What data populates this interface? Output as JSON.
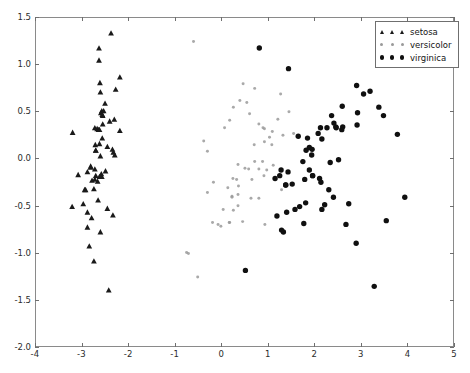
{
  "figure": {
    "background": "#ffffff",
    "frame_color": "#8a8a8a"
  },
  "legend": {
    "position": "upper-right",
    "entries": [
      {
        "label": "setosa",
        "marker": "triangle",
        "color": "#1a1a1a",
        "key_name": "legend-key-setosa"
      },
      {
        "label": "versicolor",
        "marker": "small-dot",
        "color": "#9a9a9a",
        "key_name": "legend-key-versicolor"
      },
      {
        "label": "virginica",
        "marker": "filled-circle",
        "color": "#101010",
        "key_name": "legend-key-virginica"
      }
    ]
  },
  "axes": {
    "xticks": [
      -4,
      -3,
      -2,
      -1,
      0,
      1,
      2,
      3,
      4,
      5
    ],
    "xtick_labels": [
      "-4",
      "-3",
      "-2",
      "-1",
      "0",
      "1",
      "2",
      "3",
      "4",
      "5"
    ],
    "yticks": [
      -2.0,
      -1.5,
      -1.0,
      -0.5,
      0.0,
      0.5,
      1.0,
      1.5
    ],
    "ytick_labels": [
      "-2.0",
      "-1.5",
      "-1.0",
      "-0.5",
      "0.0",
      "0.5",
      "1.0",
      "1.5"
    ]
  },
  "chart_data": {
    "type": "scatter",
    "title": "",
    "xlabel": "",
    "ylabel": "",
    "xlim": [
      -4,
      5
    ],
    "ylim": [
      -2.0,
      1.5
    ],
    "grid": false,
    "legend_position": "upper right",
    "series": [
      {
        "name": "setosa",
        "marker": "triangle",
        "color": "#1a1a1a",
        "size": 5,
        "points": [
          [
            -2.68,
            0.32
          ],
          [
            -2.71,
            -0.18
          ],
          [
            -2.89,
            -0.14
          ],
          [
            -2.75,
            -0.32
          ],
          [
            -2.73,
            0.33
          ],
          [
            -2.28,
            0.74
          ],
          [
            -2.82,
            -0.08
          ],
          [
            -2.63,
            0.16
          ],
          [
            -2.89,
            -0.57
          ],
          [
            -2.67,
            -0.24
          ],
          [
            -2.51,
            0.59
          ],
          [
            -2.61,
            0.03
          ],
          [
            -2.79,
            -0.23
          ],
          [
            -3.22,
            -0.51
          ],
          [
            -2.64,
            1.18
          ],
          [
            -2.38,
            1.34
          ],
          [
            -2.62,
            0.81
          ],
          [
            -2.65,
            0.31
          ],
          [
            -2.19,
            0.87
          ],
          [
            -2.58,
            0.51
          ],
          [
            -2.31,
            0.42
          ],
          [
            -2.54,
            0.51
          ],
          [
            -3.21,
            0.28
          ],
          [
            -2.3,
            0.04
          ],
          [
            -2.35,
            0.1
          ],
          [
            -2.5,
            -0.13
          ],
          [
            -2.46,
            0.13
          ],
          [
            -2.56,
            0.37
          ],
          [
            -2.63,
            0.31
          ],
          [
            -2.63,
            -0.19
          ],
          [
            -2.58,
            -0.19
          ],
          [
            -2.41,
            0.4
          ],
          [
            -2.61,
            0.71
          ],
          [
            -2.64,
            1.05
          ],
          [
            -2.59,
            -0.16
          ],
          [
            -2.73,
            -0.11
          ],
          [
            -2.6,
            0.49
          ],
          [
            -2.72,
            0.15
          ],
          [
            -2.95,
            -0.33
          ],
          [
            -2.57,
            0.22
          ],
          [
            -2.71,
            0.09
          ],
          [
            -2.89,
            -0.73
          ],
          [
            -2.93,
            -0.33
          ],
          [
            -2.33,
            0.07
          ],
          [
            -2.19,
            0.3
          ],
          [
            -2.73,
            -0.22
          ],
          [
            -2.56,
            0.46
          ],
          [
            -2.82,
            -0.09
          ],
          [
            -2.57,
            0.47
          ],
          [
            -2.71,
            0.09
          ],
          [
            -2.85,
            -0.93
          ],
          [
            -2.75,
            -1.09
          ],
          [
            -2.43,
            -1.4
          ],
          [
            -3.09,
            -0.17
          ],
          [
            -2.98,
            -0.48
          ],
          [
            -2.34,
            -0.6
          ],
          [
            -2.66,
            -0.44
          ],
          [
            -2.46,
            -0.53
          ],
          [
            -2.8,
            -0.63
          ],
          [
            -2.61,
            -0.78
          ]
        ]
      },
      {
        "name": "versicolor",
        "marker": "small-dot",
        "color": "#9a9a9a",
        "size": 3,
        "points": [
          [
            1.28,
            0.69
          ],
          [
            0.93,
            0.32
          ],
          [
            1.46,
            0.5
          ],
          [
            0.18,
            -0.68
          ],
          [
            1.09,
            0.15
          ],
          [
            0.64,
            -0.42
          ],
          [
            1.1,
            0.29
          ],
          [
            -0.75,
            -1.0
          ],
          [
            1.04,
            0.23
          ],
          [
            -0.01,
            -0.72
          ],
          [
            -0.51,
            -1.26
          ],
          [
            0.51,
            -0.1
          ],
          [
            0.26,
            -0.55
          ],
          [
            0.98,
            -0.12
          ],
          [
            -0.17,
            -0.25
          ],
          [
            0.93,
            0.18
          ],
          [
            0.66,
            -0.22
          ],
          [
            0.23,
            -0.4
          ],
          [
            0.94,
            -0.7
          ],
          [
            0.04,
            -0.54
          ],
          [
            1.12,
            -0.07
          ],
          [
            0.36,
            -0.06
          ],
          [
            1.3,
            -0.33
          ],
          [
            0.92,
            -0.18
          ],
          [
            0.71,
            0.15
          ],
          [
            0.9,
            0.33
          ],
          [
            1.33,
            0.25
          ],
          [
            1.56,
            0.27
          ],
          [
            0.81,
            -0.11
          ],
          [
            -0.3,
            -0.36
          ],
          [
            -0.07,
            -0.7
          ],
          [
            -0.19,
            -0.68
          ],
          [
            0.14,
            -0.31
          ],
          [
            1.38,
            -0.28
          ],
          [
            0.59,
            -0.11
          ],
          [
            0.81,
            0.37
          ],
          [
            1.22,
            0.42
          ],
          [
            0.81,
            -0.42
          ],
          [
            0.25,
            -0.21
          ],
          [
            0.17,
            -0.68
          ],
          [
            0.46,
            -0.67
          ],
          [
            0.89,
            -0.03
          ],
          [
            0.23,
            -0.41
          ],
          [
            -0.71,
            -1.01
          ],
          [
            0.36,
            -0.5
          ],
          [
            0.33,
            -0.22
          ],
          [
            0.37,
            -0.29
          ],
          [
            0.72,
            -0.03
          ],
          [
            -0.6,
            1.25
          ],
          [
            0.36,
            -0.38
          ],
          [
            0.72,
            0.75
          ],
          [
            0.4,
            0.62
          ],
          [
            0.26,
            0.55
          ],
          [
            0.55,
            0.6
          ],
          [
            0.18,
            0.41
          ],
          [
            0.07,
            0.33
          ],
          [
            -0.38,
            0.19
          ],
          [
            -0.3,
            0.08
          ],
          [
            0.47,
            0.8
          ],
          [
            0.61,
            0.48
          ]
        ]
      },
      {
        "name": "virginica",
        "marker": "filled-circle",
        "color": "#101010",
        "size": 5,
        "points": [
          [
            2.53,
            -0.01
          ],
          [
            1.41,
            -0.57
          ],
          [
            2.62,
            0.34
          ],
          [
            1.97,
            -0.18
          ],
          [
            2.35,
            -0.04
          ],
          [
            3.4,
            0.55
          ],
          [
            0.52,
            -1.19
          ],
          [
            2.93,
            0.36
          ],
          [
            2.32,
            -0.33
          ],
          [
            2.92,
            0.78
          ],
          [
            1.66,
            0.24
          ],
          [
            1.8,
            -0.22
          ],
          [
            2.17,
            0.21
          ],
          [
            1.34,
            -0.78
          ],
          [
            1.59,
            -0.54
          ],
          [
            1.9,
            0.12
          ],
          [
            1.95,
            0.04
          ],
          [
            3.49,
            1.18
          ],
          [
            3.8,
            0.26
          ],
          [
            1.3,
            -0.76
          ],
          [
            2.43,
            0.38
          ],
          [
            1.2,
            -0.61
          ],
          [
            3.5,
            0.46
          ],
          [
            1.39,
            -0.28
          ],
          [
            2.28,
            0.33
          ],
          [
            2.61,
            0.56
          ],
          [
            1.26,
            -0.18
          ],
          [
            1.29,
            -0.12
          ],
          [
            2.12,
            -0.21
          ],
          [
            2.38,
            0.46
          ],
          [
            2.94,
            0.49
          ],
          [
            3.21,
            0.72
          ],
          [
            2.15,
            -0.25
          ],
          [
            1.44,
            -0.14
          ],
          [
            1.78,
            -0.69
          ],
          [
            3.07,
            0.69
          ],
          [
            2.14,
            0.33
          ],
          [
            1.83,
            0.09
          ],
          [
            1.16,
            -0.21
          ],
          [
            2.09,
            0.27
          ],
          [
            2.48,
            0.33
          ],
          [
            1.86,
            0.22
          ],
          [
            1.97,
            -0.18
          ],
          [
            2.6,
            0.31
          ],
          [
            2.47,
            0.34
          ],
          [
            1.96,
            0.1
          ],
          [
            1.53,
            -0.27
          ],
          [
            1.76,
            -0.03
          ],
          [
            1.9,
            -0.12
          ],
          [
            1.39,
            -0.28
          ],
          [
            3.3,
            -1.36
          ],
          [
            2.91,
            -0.9
          ],
          [
            2.69,
            -0.7
          ],
          [
            3.56,
            -0.66
          ],
          [
            2.17,
            -0.54
          ],
          [
            1.45,
            0.96
          ],
          [
            0.82,
            1.18
          ],
          [
            3.96,
            -0.41
          ],
          [
            2.42,
            -0.41
          ],
          [
            1.82,
            -0.47
          ],
          [
            2.75,
            -0.48
          ],
          [
            2.23,
            -0.49
          ],
          [
            1.69,
            -0.51
          ]
        ]
      }
    ]
  }
}
